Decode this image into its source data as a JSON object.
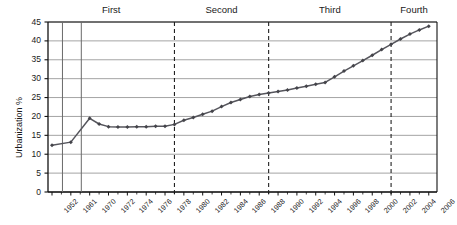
{
  "chart_data": {
    "type": "line",
    "title": "",
    "xlabel": "",
    "ylabel": "Urbanization %",
    "ylim": [
      0,
      45
    ],
    "ytick_step": 5,
    "yticks": [
      "0",
      "5",
      "10",
      "15",
      "20",
      "25",
      "30",
      "35",
      "40",
      "45"
    ],
    "grid": true,
    "grid_orientation": "horizontal",
    "legend": "none",
    "marker": "diamond",
    "line_color": "#55555c",
    "marker_color": "#44444a",
    "grid_color": "#9a9a9a",
    "axis_color": "#111111",
    "xtick_labels": [
      "1952",
      "1961",
      "1970",
      "1972",
      "1974",
      "1976",
      "1978",
      "1980",
      "1982",
      "1984",
      "1986",
      "1988",
      "1990",
      "1992",
      "1994",
      "1996",
      "1998",
      "2000",
      "2002",
      "2004",
      "2006"
    ],
    "x": [
      1952,
      1961,
      1970,
      1971,
      1972,
      1973,
      1974,
      1975,
      1976,
      1977,
      1978,
      1979,
      1980,
      1981,
      1982,
      1983,
      1984,
      1985,
      1986,
      1987,
      1988,
      1989,
      1990,
      1991,
      1992,
      1993,
      1994,
      1995,
      1996,
      1997,
      1998,
      1999,
      2000,
      2001,
      2002,
      2003,
      2004,
      2005,
      2006
    ],
    "values": [
      12.4,
      13.2,
      19.5,
      18.0,
      17.3,
      17.2,
      17.2,
      17.3,
      17.3,
      17.4,
      17.4,
      17.9,
      19.0,
      19.7,
      20.6,
      21.4,
      22.6,
      23.7,
      24.5,
      25.3,
      25.8,
      26.2,
      26.6,
      27.0,
      27.5,
      28.0,
      28.5,
      29.0,
      30.5,
      32.0,
      33.4,
      34.8,
      36.2,
      37.7,
      39.1,
      40.5,
      41.8,
      42.9,
      43.9
    ],
    "divider_lines": [
      {
        "at": 1979,
        "style": "dashed"
      },
      {
        "at": 1989,
        "style": "dashed"
      },
      {
        "at": 2002,
        "style": "dashed"
      }
    ],
    "solid_vertical_lines": [
      1957,
      1966
    ],
    "phases": [
      {
        "label": "First"
      },
      {
        "label": "Second"
      },
      {
        "label": "Third"
      },
      {
        "label": "Fourth"
      }
    ]
  }
}
